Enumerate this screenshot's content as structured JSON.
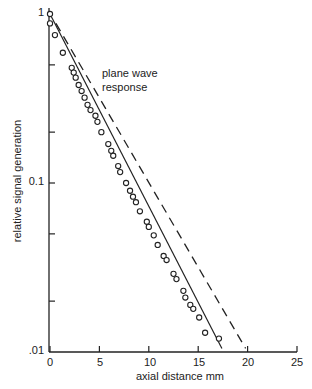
{
  "chart_data": {
    "type": "scatter",
    "title": "",
    "xlabel": "axial distance mm",
    "ylabel": "relative signal generation",
    "xlim": [
      0,
      25
    ],
    "ylim": [
      0.01,
      1
    ],
    "yscale": "log",
    "grid": false,
    "x_ticks": [
      "0",
      "5",
      "10",
      "15",
      "20",
      "25"
    ],
    "y_tick_labels": [
      "1",
      "0.1",
      ".01"
    ],
    "y_minor_ticks": [
      0.5,
      0.2,
      0.05,
      0.02
    ],
    "annotations": [
      {
        "text_line1": "plane wave",
        "text_line2": "response",
        "x": 5.3,
        "y": 0.4
      }
    ],
    "series": [
      {
        "name": "measured",
        "style": "circles with solid fit line",
        "x": [
          0,
          0,
          0.5,
          1.3,
          2.2,
          2.4,
          2.6,
          2.9,
          3.2,
          3.5,
          3.8,
          4.1,
          4.6,
          4.8,
          5.2,
          5.9,
          6.2,
          6.4,
          6.9,
          7.1,
          7.7,
          8.1,
          8.4,
          8.7,
          9.1,
          9.8,
          10.0,
          10.5,
          10.9,
          11.5,
          11.8,
          12.5,
          12.8,
          13.5,
          13.7,
          14.2,
          14.5,
          15.1,
          15.7,
          17.1
        ],
        "values": [
          1.0,
          0.88,
          0.75,
          0.59,
          0.48,
          0.45,
          0.42,
          0.38,
          0.35,
          0.32,
          0.29,
          0.27,
          0.25,
          0.23,
          0.2,
          0.17,
          0.155,
          0.145,
          0.126,
          0.116,
          0.1,
          0.09,
          0.083,
          0.077,
          0.068,
          0.059,
          0.055,
          0.049,
          0.043,
          0.037,
          0.035,
          0.029,
          0.027,
          0.023,
          0.021,
          0.019,
          0.018,
          0.016,
          0.013,
          0.012
        ],
        "fit_line": {
          "x": [
            0,
            17.4
          ],
          "values": [
            1.0,
            0.0105
          ]
        }
      },
      {
        "name": "plane wave response",
        "style": "dashed line",
        "x": [
          0.6,
          19.8
        ],
        "values": [
          0.88,
          0.0105
        ]
      }
    ]
  }
}
